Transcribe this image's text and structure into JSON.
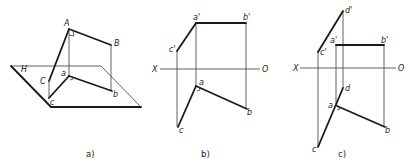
{
  "figure": {
    "background": "#ffffff",
    "ink": "#1a1a1a",
    "panels": [
      {
        "id": "a",
        "caption": "a)",
        "caption_pos": [
          86,
          157
        ],
        "plane": {
          "label": "H",
          "label_pos": [
            21,
            72
          ],
          "points": [
            [
              11,
              66
            ],
            [
              101,
              66
            ],
            [
              141,
              107
            ],
            [
              51,
              107
            ]
          ]
        },
        "thick": [
          [
            [
              69,
              29
            ],
            [
              111,
              45
            ]
          ],
          [
            [
              69,
              29
            ],
            [
              49,
              81
            ]
          ],
          [
            [
              49,
              98
            ],
            [
              69,
              76
            ]
          ],
          [
            [
              69,
              76
            ],
            [
              112,
              91
            ]
          ]
        ],
        "thin": [
          [
            [
              69,
              29
            ],
            [
              69,
              76
            ]
          ],
          [
            [
              111,
              45
            ],
            [
              111,
              91
            ]
          ],
          [
            [
              49,
              81
            ],
            [
              49,
              98
            ]
          ]
        ],
        "right_angles": [
          {
            "path": "M69,35 L74,36 L73,31"
          },
          {
            "path": "M70,80 L73,79 L72,76"
          }
        ],
        "labels": [
          {
            "text": "A",
            "pos": [
              64,
              26
            ]
          },
          {
            "text": "B",
            "pos": [
              114,
              46
            ]
          },
          {
            "text": "C",
            "pos": [
              40,
              84
            ]
          },
          {
            "text": "a",
            "pos": [
              61,
              76
            ]
          },
          {
            "text": "b",
            "pos": [
              113,
              97
            ]
          },
          {
            "text": "c",
            "pos": [
              50,
              105
            ]
          }
        ]
      },
      {
        "id": "b",
        "caption": "b)",
        "caption_pos": [
          201,
          157
        ],
        "axis": {
          "from": [
            160,
            69
          ],
          "to": [
            260,
            69
          ],
          "x_label": "X",
          "x_label_pos": [
            152,
            72
          ],
          "o_label": "O",
          "o_label_pos": [
            262,
            72
          ]
        },
        "thick": [
          [
            [
              196,
              23
            ],
            [
              246,
              23
            ]
          ],
          [
            [
              196,
              23
            ],
            [
              177,
              51
            ]
          ],
          [
            [
              196,
              86
            ],
            [
              247,
              109
            ]
          ],
          [
            [
              196,
              86
            ],
            [
              178,
              127
            ]
          ]
        ],
        "thin": [
          [
            [
              196,
              23
            ],
            [
              196,
              86
            ]
          ],
          [
            [
              246,
              23
            ],
            [
              246,
              109
            ]
          ],
          [
            [
              177,
              51
            ],
            [
              177,
              127
            ]
          ]
        ],
        "right_angles": [
          {
            "path": "M197,91 L200,90 L199,87"
          }
        ],
        "labels": [
          {
            "text": "a'",
            "pos": [
              193,
              20
            ]
          },
          {
            "text": "b'",
            "pos": [
              243,
              20
            ]
          },
          {
            "text": "c'",
            "pos": [
              169,
              52
            ]
          },
          {
            "text": "a",
            "pos": [
              199,
              85
            ]
          },
          {
            "text": "b",
            "pos": [
              247,
              115
            ]
          },
          {
            "text": "c",
            "pos": [
              179,
              133
            ]
          }
        ]
      },
      {
        "id": "c",
        "caption": "c)",
        "caption_pos": [
          338,
          157
        ],
        "axis": {
          "from": [
            300,
            68
          ],
          "to": [
            396,
            68
          ],
          "x_label": "X",
          "x_label_pos": [
            293,
            71
          ],
          "o_label": "O",
          "o_label_pos": [
            398,
            71
          ]
        },
        "thick": [
          [
            [
              343,
              11
            ],
            [
              318,
              52
            ]
          ],
          [
            [
              336,
              45
            ],
            [
              384,
              45
            ]
          ],
          [
            [
              343,
              88
            ],
            [
              318,
              147
            ]
          ],
          [
            [
              337,
              106
            ],
            [
              385,
              127
            ]
          ]
        ],
        "thin": [
          [
            [
              343,
              11
            ],
            [
              343,
              88
            ]
          ],
          [
            [
              336,
              45
            ],
            [
              336,
              106
            ]
          ],
          [
            [
              384,
              45
            ],
            [
              384,
              127
            ]
          ],
          [
            [
              318,
              52
            ],
            [
              318,
              147
            ]
          ]
        ],
        "right_angles": [
          {
            "path": "M337,110 L340,109 L339,106"
          }
        ],
        "labels": [
          {
            "text": "d'",
            "pos": [
              345,
              13
            ]
          },
          {
            "text": "a'",
            "pos": [
              330,
              43
            ]
          },
          {
            "text": "b'",
            "pos": [
              381,
              43
            ]
          },
          {
            "text": "c'",
            "pos": [
              320,
              55
            ]
          },
          {
            "text": "d",
            "pos": [
              345,
              91
            ]
          },
          {
            "text": "a",
            "pos": [
              328,
              108
            ]
          },
          {
            "text": "b",
            "pos": [
              385,
              133
            ]
          },
          {
            "text": "c",
            "pos": [
              312,
              152
            ]
          }
        ]
      }
    ]
  }
}
